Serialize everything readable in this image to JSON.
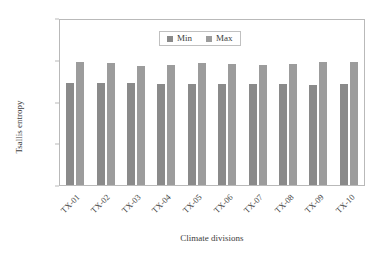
{
  "chart_data": {
    "type": "bar",
    "title": "",
    "subtitle": "",
    "xlabel": "Climate divisions",
    "ylabel": "Tsallis entropy",
    "categories": [
      "TX-01",
      "TX-02",
      "TX-03",
      "TX-04",
      "TX-05",
      "TX-06",
      "TX-07",
      "TX-08",
      "TX-09",
      "TX-10"
    ],
    "series": [
      {
        "name": "Min",
        "color": "#8a8a8a",
        "values": [
          0.487,
          0.488,
          0.488,
          0.486,
          0.486,
          0.486,
          0.486,
          0.482,
          0.478,
          0.485
        ]
      },
      {
        "name": "Max",
        "color": "#9c9c9c",
        "values": [
          0.591,
          0.585,
          0.57,
          0.575,
          0.586,
          0.578,
          0.576,
          0.581,
          0.587,
          0.591
        ]
      }
    ],
    "ylim": [
      0.0,
      0.8
    ],
    "yticks": [
      "0.00",
      "0.20",
      "0.40",
      "0.60",
      "0.80"
    ],
    "ytick_values": [
      0.0,
      0.2,
      0.4,
      0.6,
      0.8
    ],
    "grid": false,
    "legend_position": "top-center",
    "legend": [
      "Min",
      "Max"
    ],
    "annotations": []
  }
}
